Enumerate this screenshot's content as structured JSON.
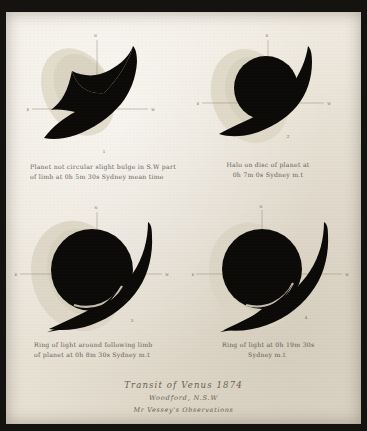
{
  "plate": {
    "paper_color": "#ebe5d9",
    "ink_color": "#0c0a08",
    "halo_color": "#d9d2c2",
    "axis_color": "#8d8474",
    "border_color": "#151310"
  },
  "figures": [
    {
      "id": "fig-1",
      "number": "1",
      "axis_labels": {
        "north": "N",
        "south": "S",
        "east": "E",
        "west": "W"
      },
      "caption_lines": [
        "Planet not circular slight bulge in S.W part",
        "of limb at  0h 5m 30s  Sydney mean time"
      ],
      "caption_time": {
        "hours": "0",
        "minutes": "5",
        "seconds": "30"
      },
      "description": "crescent-shaped black silhouette with light halo"
    },
    {
      "id": "fig-2",
      "number": "2",
      "axis_labels": {
        "north": "N",
        "south": "S",
        "east": "E",
        "west": "W"
      },
      "caption_lines": [
        "Halo on disc of planet at",
        "0h 7m 0s  Sydney m.t"
      ],
      "caption_time": {
        "hours": "0",
        "minutes": "7",
        "seconds": "0"
      },
      "description": "dark disc with tail and halo"
    },
    {
      "id": "fig-3",
      "number": "3",
      "axis_labels": {
        "north": "N",
        "south": "S",
        "east": "E",
        "west": "W"
      },
      "caption_lines": [
        "Ring of light around following limb",
        "of planet at  0h 8m 30s  Sydney m.t"
      ],
      "caption_time": {
        "hours": "0",
        "minutes": "8",
        "seconds": "30"
      },
      "description": "large black disc with ring of light on following limb"
    },
    {
      "id": "fig-4",
      "number": "4",
      "axis_labels": {
        "north": "N",
        "south": "S",
        "east": "E",
        "west": "W"
      },
      "caption_lines": [
        "Ring of light at  0h 19m 30s",
        "Sydney m.t"
      ],
      "caption_time": {
        "hours": "0",
        "minutes": "19",
        "seconds": "30"
      },
      "description": "large black disc with ring of light"
    }
  ],
  "title_block": {
    "main": "Transit of Venus 1874",
    "place": "Woodford, N.S.W",
    "observer": "Mr Vessey's Observations"
  }
}
